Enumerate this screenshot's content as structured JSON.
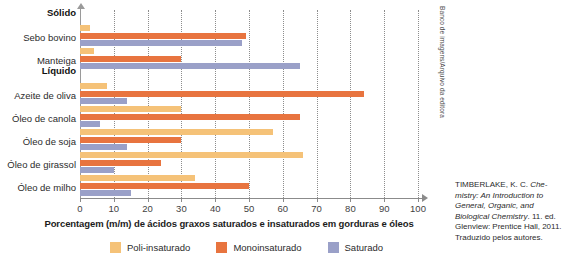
{
  "chart_data": {
    "type": "bar",
    "orientation": "horizontal",
    "title": "",
    "xlabel": "Porcentagem (m/m) de ácidos graxos saturados e insaturados em gorduras e óleos",
    "ylabel": "",
    "xlim": [
      0,
      100
    ],
    "xticks": [
      0,
      10,
      20,
      30,
      40,
      50,
      60,
      70,
      80,
      90,
      100
    ],
    "grid": true,
    "grid_axis": "x",
    "legend_position": "bottom",
    "group_headers": [
      {
        "label": "Sólido",
        "before_category": "Sebo bovino"
      },
      {
        "label": "Líquido",
        "before_category": "Azeite de oliva"
      }
    ],
    "categories": [
      "Sebo bovino",
      "Manteiga",
      "Azeite de oliva",
      "Óleo de canola",
      "Óleo de soja",
      "Óleo de girassol",
      "Óleo de milho"
    ],
    "series": [
      {
        "name": "Poli-insaturado",
        "color": "#f5c278",
        "values": [
          3,
          4,
          8,
          30,
          57,
          66,
          34
        ]
      },
      {
        "name": "Monoinsaturado",
        "color": "#e8743f",
        "values": [
          49,
          30,
          84,
          65,
          30,
          24,
          50
        ]
      },
      {
        "name": "Saturado",
        "color": "#9aa0c8",
        "values": [
          48,
          65,
          14,
          6,
          14,
          10,
          15
        ]
      }
    ]
  },
  "axis": {
    "title": "Porcentagem (m/m) de ácidos graxos saturados e insaturados em gorduras e óleos",
    "tick_labels": [
      "0",
      "10",
      "20",
      "30",
      "40",
      "50",
      "60",
      "70",
      "80",
      "90",
      "100"
    ]
  },
  "legend": {
    "items": [
      {
        "label": "Poli-insaturado",
        "color": "#f5c278"
      },
      {
        "label": "Monoinsaturado",
        "color": "#e8743f"
      },
      {
        "label": "Saturado",
        "color": "#9aa0c8"
      }
    ]
  },
  "side_credit": "Banco de imagens/Arquivo da editora",
  "source": {
    "line1": "TIMBERLAKE, K. C. ",
    "italic1": "Che-",
    "italic2": "mistry: An Introduction",
    "italic3": "to General, Organic, and",
    "italic4": "Biological Chemistry",
    "line2": ". 11. ed.",
    "line3": "Glenview: Prentice",
    "line4": "Hall, 2011. Traduzido",
    "line5": "pelos autores."
  }
}
